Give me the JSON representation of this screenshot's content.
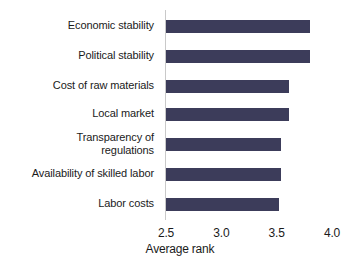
{
  "chart_data": {
    "type": "bar",
    "orientation": "horizontal",
    "title": "",
    "subtitle": "",
    "xlabel": "Average rank",
    "ylabel": "",
    "categories": [
      "Economic stability",
      "Political stability",
      "Cost of raw materials",
      "Local market",
      "Transparency of\nregulations",
      "Availability of skilled labor",
      "Labor costs"
    ],
    "values": [
      3.8,
      3.8,
      3.61,
      3.61,
      3.54,
      3.54,
      3.52
    ],
    "xlim": [
      2.5,
      4.0
    ],
    "xticks": [
      "2.5",
      "3.0",
      "3.5",
      "4.0"
    ],
    "xtick_values": [
      2.5,
      3.0,
      3.5,
      4.0
    ],
    "grid": false,
    "legend": false,
    "bar_color": "#3c3c5a",
    "axis_color": "#c9c9c9",
    "text_color": "#1a1a1a",
    "background": "#ffffff"
  }
}
